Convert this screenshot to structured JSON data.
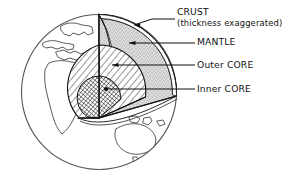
{
  "figure": {
    "globe": {
      "center_x": 99,
      "center_y": 92,
      "radius": 78,
      "continents_visible": [
        "Europe",
        "Africa",
        "Asia",
        "Australia"
      ]
    },
    "layers": [
      {
        "id": "crust",
        "label": "CRUST",
        "note": "(thickness exaggerated)",
        "fill": "white",
        "pattern": "thin-band"
      },
      {
        "id": "mantle",
        "label": "MANTLE",
        "fill": "#d8d8d8",
        "pattern": "stipple"
      },
      {
        "id": "outer-core",
        "label": "Outer CORE",
        "fill": "#ffffff",
        "pattern": "diagonal-hatch"
      },
      {
        "id": "inner-core",
        "label": "Inner CORE",
        "fill": "#ffffff",
        "pattern": "cross-hatch"
      }
    ],
    "callouts": [
      {
        "id": "crust-callout",
        "label": "CRUST",
        "x": 177,
        "y": 15
      },
      {
        "id": "crust-note",
        "label": "(thickness exaggerated)",
        "x": 177,
        "y": 26
      },
      {
        "id": "mantle-callout",
        "label": "MANTLE",
        "x": 197,
        "y": 45
      },
      {
        "id": "outer-core-callout",
        "label": "Outer CORE",
        "x": 197,
        "y": 68
      },
      {
        "id": "inner-core-callout",
        "label": "Inner CORE",
        "x": 197,
        "y": 92
      }
    ],
    "colors": {
      "ink": "#111111",
      "outline": "#555555",
      "mantle_fill": "#d8d8d8",
      "background": "#ffffff"
    }
  }
}
